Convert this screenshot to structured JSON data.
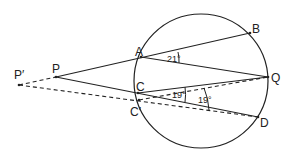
{
  "diagram": {
    "type": "circle-geometry",
    "circle": {
      "cx": 201,
      "cy": 81,
      "r": 67
    },
    "points": {
      "P_prime": {
        "label": "P′",
        "x": 19,
        "y": 85
      },
      "P": {
        "label": "P",
        "x": 56,
        "y": 77
      },
      "A": {
        "label": "A",
        "x": 141,
        "y": 57
      },
      "B": {
        "label": "B",
        "x": 250,
        "y": 33
      },
      "C": {
        "label": "C",
        "x": 138,
        "y": 93
      },
      "C_prime": {
        "label": "C′",
        "x": 139,
        "y": 100
      },
      "Q": {
        "label": "Q",
        "x": 268,
        "y": 77
      },
      "D": {
        "label": "D",
        "x": 258,
        "y": 117
      }
    },
    "angles": {
      "AQ_AB": "21°",
      "CQ_CD": "19°",
      "CprimeQ_CprimeD": "19°"
    },
    "lines": {
      "solid": [
        "P-B",
        "A-Q",
        "P-D",
        "C-Q"
      ],
      "dashed": [
        "P'-P",
        "P'-D",
        "C'-Q"
      ]
    }
  }
}
